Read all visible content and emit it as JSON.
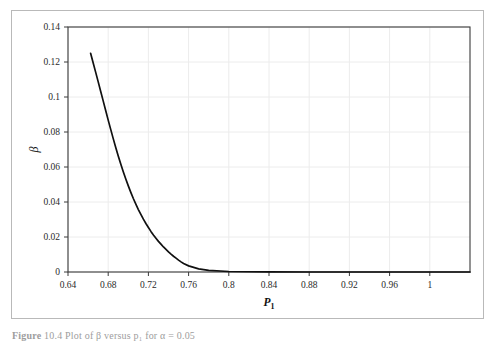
{
  "figure": {
    "caption_fragment_prefix": "Figure",
    "caption_fragment_rest": " 10.4 Plot of β versus p₁ for α = 0.05"
  },
  "chart_data": {
    "type": "line",
    "title": "",
    "xlabel": "P",
    "xlabel_subscript": "1",
    "ylabel": "β",
    "xlim": [
      0.64,
      1.04
    ],
    "ylim": [
      0,
      0.14
    ],
    "xticks": [
      0.64,
      0.68,
      0.72,
      0.76,
      0.8,
      0.84,
      0.88,
      0.92,
      0.96,
      1
    ],
    "xticklabels": [
      "0.64",
      "0.68",
      "0.72",
      "0.76",
      "0.8",
      "0.84",
      "0.88",
      "0.92",
      "0.96",
      "1"
    ],
    "yticks": [
      0,
      0.02,
      0.04,
      0.06,
      0.08,
      0.1,
      0.12,
      0.14
    ],
    "yticklabels": [
      "0",
      "0.02",
      "0.04",
      "0.06",
      "0.08",
      "0.1",
      "0.12",
      "0.14"
    ],
    "grid": true,
    "grid_color": "#ececec",
    "legend": null,
    "series": [
      {
        "name": "beta",
        "color": "#101010",
        "linewidth": 1.7,
        "x": [
          0.6625,
          0.665,
          0.6675,
          0.67,
          0.6725,
          0.675,
          0.6775,
          0.68,
          0.6825,
          0.685,
          0.6875,
          0.69,
          0.6925,
          0.695,
          0.6975,
          0.7,
          0.7025,
          0.705,
          0.7075,
          0.71,
          0.7125,
          0.715,
          0.7175,
          0.72,
          0.7225,
          0.725,
          0.7275,
          0.73,
          0.7325,
          0.735,
          0.7375,
          0.74,
          0.7425,
          0.745,
          0.7475,
          0.75,
          0.7525,
          0.755,
          0.76,
          0.77,
          0.78,
          0.8,
          0.84,
          0.88,
          0.92,
          0.96,
          1.0,
          1.04
        ],
        "y": [
          0.125,
          0.1196,
          0.1142,
          0.1088,
          0.1033,
          0.0978,
          0.0923,
          0.0868,
          0.0815,
          0.0762,
          0.0712,
          0.0663,
          0.0617,
          0.0573,
          0.0531,
          0.0492,
          0.0455,
          0.042,
          0.0388,
          0.0357,
          0.0329,
          0.0302,
          0.0277,
          0.0254,
          0.0232,
          0.0212,
          0.0193,
          0.0175,
          0.0159,
          0.0143,
          0.0129,
          0.0115,
          0.0102,
          0.009,
          0.0079,
          0.0068,
          0.0058,
          0.0049,
          0.0035,
          0.0018,
          0.0009,
          0.0003,
          5e-05,
          1e-05,
          2e-06,
          5e-07,
          0.0,
          0.0
        ]
      }
    ]
  },
  "geometry": {
    "plot_left": 68,
    "plot_right": 470,
    "plot_top": 27,
    "plot_bottom": 272
  }
}
